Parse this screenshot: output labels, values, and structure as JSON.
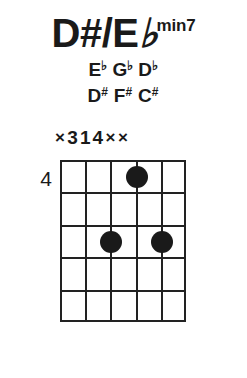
{
  "chord": {
    "title": {
      "root": "D#/E",
      "root_flat_symbol": "♭",
      "quality": "min7",
      "full_text": "D#/E♭min7"
    },
    "note_names_flat": [
      "",
      "E♭",
      "G♭",
      "D♭",
      "",
      ""
    ],
    "note_names_sharp": [
      "",
      "D#",
      "F#",
      "C#",
      "",
      ""
    ],
    "fingering": [
      "×",
      "3",
      "1",
      "4",
      "×",
      "×"
    ],
    "fret_position_label": "4",
    "colors": {
      "ink": "#1a1a1a",
      "grid": "#222222",
      "background": "#ffffff"
    },
    "diagram": {
      "strings": 6,
      "frets": 5,
      "starting_fret": 4,
      "dots": [
        {
          "string": 3,
          "fret": 1
        },
        {
          "string": 2,
          "fret": 3
        },
        {
          "string": 4,
          "fret": 3
        }
      ]
    }
  }
}
